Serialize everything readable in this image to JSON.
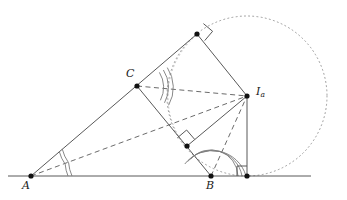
{
  "figure": {
    "type": "geometry-diagram",
    "canvas": {
      "width": 347,
      "height": 200,
      "background": "#ffffff"
    },
    "colors": {
      "stroke": "#595959",
      "dashed": "#6b6b6b",
      "dotted": "#9a9a9a",
      "point": "#111111",
      "label": "#1a1a1a"
    },
    "labels": {
      "A": "A",
      "B": "B",
      "C": "C",
      "Ia_base": "I",
      "Ia_sub": "a"
    },
    "points": [
      {
        "name": "A",
        "label": "A",
        "x": 31,
        "y": 176,
        "marked": true
      },
      {
        "name": "B",
        "label": "B",
        "x": 211,
        "y": 176,
        "marked": true
      },
      {
        "name": "C",
        "label": "C",
        "x": 137,
        "y": 86,
        "marked": true
      },
      {
        "name": "Ia",
        "label": "Ia",
        "x": 247,
        "y": 96,
        "marked": true
      },
      {
        "name": "Ta",
        "label": "",
        "x": 247,
        "y": 176,
        "marked": true
      },
      {
        "name": "Tb",
        "label": "",
        "x": 197,
        "y": 34,
        "marked": true
      },
      {
        "name": "Tc",
        "label": "",
        "x": 187,
        "y": 146,
        "marked": true
      }
    ],
    "excircle": {
      "center_x": 247,
      "center_y": 96,
      "radius": 80,
      "style": "dotted"
    },
    "incircle_arc": {
      "center_x": 150,
      "center_y": 128,
      "radius": 44,
      "style": "dotted"
    },
    "solid_segments": [
      {
        "name": "baseline",
        "x1": 8,
        "y1": 176,
        "x2": 311,
        "y2": 176
      },
      {
        "name": "side-AC-extended",
        "x1": 31,
        "y1": 176,
        "x2": 197,
        "y2": 34
      },
      {
        "name": "side-AB",
        "x1": 31,
        "y1": 176,
        "x2": 211,
        "y2": 176
      },
      {
        "name": "side-BC-extended",
        "x1": 211,
        "y1": 176,
        "x2": 138,
        "y2": 86
      },
      {
        "name": "tangent-Tb-Ia",
        "x1": 197,
        "y1": 34,
        "x2": 247,
        "y2": 96
      },
      {
        "name": "tangent-Tc-Ia",
        "x1": 187,
        "y1": 146,
        "x2": 247,
        "y2": 96
      },
      {
        "name": "radius-Ia-Ta",
        "x1": 247,
        "y1": 96,
        "x2": 247,
        "y2": 176
      }
    ],
    "dashed_segments": [
      {
        "name": "bisector-A-Ia",
        "x1": 31,
        "y1": 176,
        "x2": 247,
        "y2": 96
      },
      {
        "name": "bisector-C-Ia",
        "x1": 137,
        "y1": 86,
        "x2": 247,
        "y2": 96
      },
      {
        "name": "bisector-B-Ia",
        "x1": 211,
        "y1": 176,
        "x2": 247,
        "y2": 96
      }
    ],
    "right_angle_marks": [
      {
        "name": "right-angle-at-Ta",
        "x": 247,
        "y": 176
      },
      {
        "name": "right-angle-at-Tb",
        "x": 197,
        "y": 34
      },
      {
        "name": "right-angle-at-Tc",
        "x": 187,
        "y": 146
      }
    ],
    "angle_arcs": [
      {
        "name": "angle-arc-A-inner",
        "vertex": "A",
        "count": 1
      },
      {
        "name": "angle-arc-A-outer",
        "vertex": "A",
        "count": 1
      },
      {
        "name": "angle-arc-C-double",
        "vertex": "C",
        "count": 2
      },
      {
        "name": "angle-arc-B-triple",
        "vertex": "B",
        "count": 3
      }
    ]
  }
}
